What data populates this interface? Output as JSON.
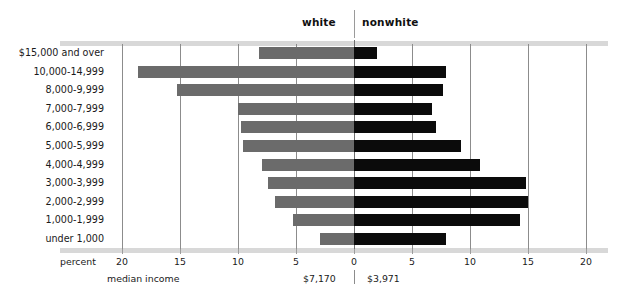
{
  "groups": {
    "left_label": "white",
    "right_label": "nonwhite"
  },
  "axis": {
    "caption": "percent",
    "ticks": [
      "20",
      "15",
      "10",
      "5",
      "0",
      "5",
      "10",
      "15",
      "20"
    ]
  },
  "median_income": {
    "caption": "median income",
    "white": "$7,170",
    "nonwhite": "$3,971"
  },
  "colors": {
    "white_bar": "#6b6b6b",
    "nonwhite_bar": "#0b0b0b",
    "gridline": "#8c8c8c",
    "rule": "#d8d8d8"
  },
  "chart_data": {
    "type": "bar",
    "orientation": "horizontal-diverging",
    "title": "",
    "xlabel": "percent",
    "ylabel": "",
    "xlim": [
      -20,
      20
    ],
    "xticks": [
      20,
      15,
      10,
      5,
      0,
      5,
      10,
      15,
      20
    ],
    "grid": true,
    "legend_position": "top",
    "categories": [
      "$15,000 and over",
      "10,000-14,999",
      "8,000-9,999",
      "7,000-7,999",
      "6,000-6,999",
      "5,000-5,999",
      "4,000-4,999",
      "3,000-3,999",
      "2,000-2,999",
      "1,000-1,999",
      "under 1,000"
    ],
    "series": [
      {
        "name": "white",
        "direction": "left",
        "values": [
          8.2,
          18.6,
          15.3,
          10.0,
          9.7,
          9.6,
          7.9,
          7.4,
          6.8,
          5.3,
          2.9
        ]
      },
      {
        "name": "nonwhite",
        "direction": "right",
        "values": [
          2.0,
          7.9,
          7.7,
          6.7,
          7.1,
          9.2,
          10.9,
          14.8,
          15.0,
          14.3,
          7.9
        ]
      }
    ],
    "annotations": [
      {
        "text": "$7,170",
        "label": "median income white"
      },
      {
        "text": "$3,971",
        "label": "median income nonwhite"
      }
    ]
  }
}
